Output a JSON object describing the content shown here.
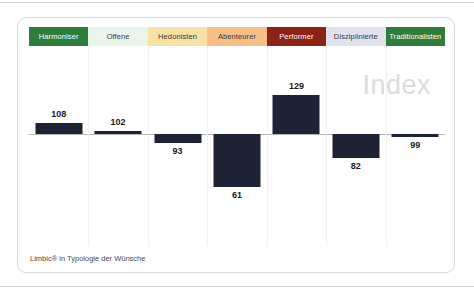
{
  "card": {
    "watermark": "Index",
    "caption": "Limbic® in Typologie der Wünsche"
  },
  "categories": [
    {
      "label": "Harmoniser",
      "bg": "#2f7d3c",
      "fg": "#ffffff"
    },
    {
      "label": "Offene",
      "bg": "#e9f5ea",
      "fg": "#3a3a3a"
    },
    {
      "label": "Hedonisten",
      "bg": "#f7e1a3",
      "fg": "#3a3a3a"
    },
    {
      "label": "Abenteurer",
      "bg": "#f5bf87",
      "fg": "#3a3a3a"
    },
    {
      "label": "Performer",
      "bg": "#8c2317",
      "fg": "#ffffff"
    },
    {
      "label": "Disziplinierte",
      "bg": "#e3e1ed",
      "fg": "#3a3a3a"
    },
    {
      "label": "Traditionalisten",
      "bg": "#2f7d3c",
      "fg": "#ffffff"
    }
  ],
  "chart_data": {
    "type": "bar",
    "title": "Index",
    "subtitle": "Limbic® in Typologie der Wünsche",
    "xlabel": "",
    "ylabel": "Index",
    "baseline": 100,
    "grid": false,
    "legend": "none",
    "categories": [
      "Harmoniser",
      "Offene",
      "Hedonisten",
      "Abenteurer",
      "Performer",
      "Disziplinierte",
      "Traditionalisten"
    ],
    "values": [
      108,
      102,
      93,
      61,
      129,
      82,
      99
    ],
    "value_labels": [
      "108",
      "102",
      "93",
      "61",
      "129",
      "82",
      "99"
    ],
    "label_position": [
      "above",
      "above",
      "below",
      "below",
      "above",
      "below",
      "below"
    ],
    "bar_color": "#1d2235",
    "ylim": [
      55,
      135
    ]
  }
}
